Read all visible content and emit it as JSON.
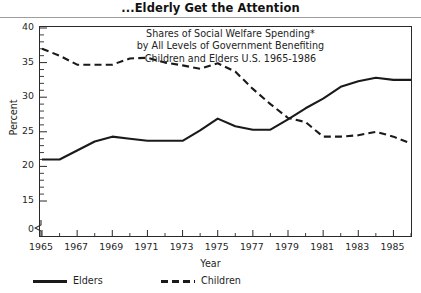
{
  "header": {
    "title": "...Elderly Get the Attention"
  },
  "caption": {
    "line1": "Shares of Social Welfare Spending*",
    "line2": "by All Levels of Government Benefiting",
    "line3": "Children and Elders U.S. 1965-1986"
  },
  "axes": {
    "ylabel": "Percent",
    "xlabel": "Year",
    "y_break": true,
    "y_break_note": "axis break between 0 and 15"
  },
  "legend": [
    {
      "key": "elders",
      "label": "Elders",
      "style": "solid",
      "color": "#1a1a1a"
    },
    {
      "key": "children",
      "label": "Children",
      "style": "dashed",
      "color": "#1a1a1a"
    }
  ],
  "colors": {
    "line": "#1a1a1a",
    "frame": "#2a2a2a",
    "rule": "#9d9d9d",
    "background": "#ffffff"
  },
  "chart_data": {
    "type": "line",
    "title": "...Elderly Get the Attention",
    "subtitle": "Shares of Social Welfare Spending* by All Levels of Government Benefiting Children and Elders U.S. 1965-1986",
    "xlabel": "Year",
    "ylabel": "Percent",
    "grid": false,
    "legend_position": "below-left",
    "xlim": [
      1965,
      1986
    ],
    "ylim": [
      15,
      40
    ],
    "y_axis_break": [
      0,
      15
    ],
    "yticks": [
      0,
      15,
      20,
      25,
      30,
      35,
      40
    ],
    "ytick_labels": [
      "0",
      "15",
      "20",
      "25",
      "30",
      "35",
      "40"
    ],
    "xticks": [
      1965,
      1966,
      1967,
      1968,
      1969,
      1970,
      1971,
      1972,
      1973,
      1974,
      1975,
      1976,
      1977,
      1978,
      1979,
      1980,
      1981,
      1982,
      1983,
      1984,
      1985,
      1986
    ],
    "xtick_labels_shown": [
      "1965",
      "1967",
      "1969",
      "1971",
      "1973",
      "1975",
      "1977",
      "1979",
      "1981",
      "1983",
      "1985"
    ],
    "x": [
      1965,
      1966,
      1967,
      1968,
      1969,
      1970,
      1971,
      1972,
      1973,
      1974,
      1975,
      1976,
      1977,
      1978,
      1979,
      1980,
      1981,
      1982,
      1983,
      1984,
      1985,
      1986
    ],
    "series": [
      {
        "name": "Elders",
        "style": "solid",
        "values": [
          21.0,
          21.0,
          22.3,
          23.6,
          24.3,
          24.0,
          23.7,
          23.7,
          23.7,
          25.2,
          26.9,
          25.8,
          25.3,
          25.3,
          26.8,
          28.4,
          29.8,
          31.5,
          32.3,
          32.8,
          32.5,
          32.5
        ]
      },
      {
        "name": "Children",
        "style": "dashed",
        "values": [
          37.0,
          36.0,
          34.7,
          34.7,
          34.7,
          35.6,
          35.7,
          35.0,
          34.6,
          34.1,
          34.9,
          33.7,
          31.2,
          29.0,
          27.0,
          26.4,
          24.3,
          24.3,
          24.5,
          25.0,
          24.3,
          23.3
        ]
      }
    ],
    "annotations": [
      "* asterisk footnote marker in caption"
    ]
  }
}
